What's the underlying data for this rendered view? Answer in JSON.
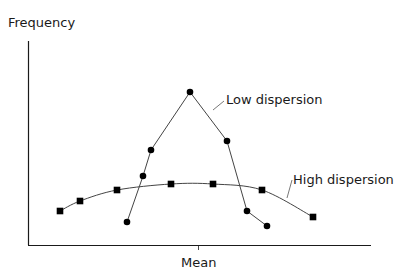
{
  "chart_data": {
    "type": "line",
    "title": "",
    "xlabel": "Mean",
    "ylabel": "Frequency",
    "grid": false,
    "legend": "inline labels",
    "series": [
      {
        "name": "Low dispersion",
        "marker": "circle",
        "points": [
          [
            127,
            222
          ],
          [
            143,
            176
          ],
          [
            151,
            150
          ],
          [
            190,
            92
          ],
          [
            227,
            141
          ],
          [
            247,
            211
          ],
          [
            267,
            226
          ]
        ]
      },
      {
        "name": "High dispersion",
        "marker": "square",
        "points": [
          [
            60,
            211
          ],
          [
            80,
            201
          ],
          [
            117,
            190
          ],
          [
            171,
            184
          ],
          [
            213,
            184
          ],
          [
            262,
            190
          ],
          [
            313,
            217
          ]
        ]
      }
    ]
  },
  "labels": {
    "ylabel": "Frequency",
    "xlabel": "Mean",
    "low": "Low dispersion",
    "high": "High dispersion"
  }
}
